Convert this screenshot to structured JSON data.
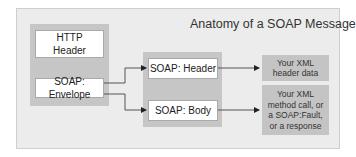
{
  "diagram": {
    "title": "Anatomy of a SOAP Message",
    "left_group": {
      "http_header": "HTTP\nHeader",
      "envelope": "SOAP: Envelope"
    },
    "middle_group": {
      "header": "SOAP: Header",
      "body": "SOAP: Body"
    },
    "right": {
      "header_data": "Your XML\nheader data",
      "body_data": "Your XML\nmethod call, or\na SOAP:Fault,\nor a response"
    },
    "colors": {
      "panel": "#ececec",
      "group": "#c6c6c6",
      "box": "#ffffff",
      "note": "#c4c4c4",
      "line": "#555555"
    }
  }
}
